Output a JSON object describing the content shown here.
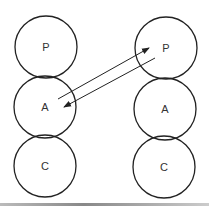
{
  "diagram": {
    "columns": [
      {
        "name": "left",
        "nodes": [
          "P",
          "A",
          "C"
        ]
      },
      {
        "name": "right",
        "nodes": [
          "P",
          "A",
          "C"
        ]
      }
    ],
    "arrows": [
      {
        "from": "left.A",
        "to": "right.P"
      },
      {
        "from": "right.P",
        "to": "left.A"
      }
    ],
    "colors": {
      "stroke": "#222222",
      "text": "#333333",
      "background": "#ffffff"
    }
  }
}
